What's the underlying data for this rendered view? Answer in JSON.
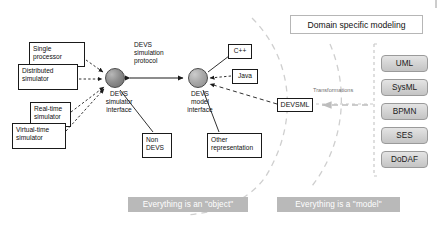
{
  "diagram": {
    "title_box": {
      "label": "Domain specific modeling"
    },
    "nodes": [
      {
        "id": "devs-simulator-interface",
        "label": "DEVS\nsimulator\ninterface"
      },
      {
        "id": "devs-model-interface",
        "label": "DEVS\nmodel\ninterface"
      }
    ],
    "simulator_boxes": [
      {
        "id": "single-processor",
        "label": "Single\nprocessor"
      },
      {
        "id": "distributed-simulator",
        "label": "Distributed\nsimulator"
      },
      {
        "id": "real-time-simulator",
        "label": "Real-time\nsimulator"
      },
      {
        "id": "virtual-time-simulator",
        "label": "Virtual-time\nsimulator"
      }
    ],
    "model_boxes": [
      {
        "id": "cpp",
        "label": "C++"
      },
      {
        "id": "java",
        "label": "Java"
      },
      {
        "id": "non-devs",
        "label": "Non\nDEVS"
      },
      {
        "id": "other-representation",
        "label": "Other\nrepresentation"
      },
      {
        "id": "devsml",
        "label": "DEVSML"
      }
    ],
    "edge_labels": [
      {
        "id": "devs-simulation-protocol",
        "label": "DEVS\nsimulation\nprotocol"
      },
      {
        "id": "transformations",
        "label": "Transformations"
      }
    ],
    "dsl_chips": [
      {
        "id": "uml",
        "label": "UML"
      },
      {
        "id": "sysml",
        "label": "SysML"
      },
      {
        "id": "bpmn",
        "label": "BPMN"
      },
      {
        "id": "ses",
        "label": "SES"
      },
      {
        "id": "dodaf",
        "label": "DoDAF"
      }
    ],
    "banners": [
      {
        "id": "object-banner",
        "label": "Everything is an \"object\""
      },
      {
        "id": "model-banner",
        "label": "Everything is a \"model\""
      }
    ],
    "colors": {
      "banner_bg": "#b9b9b9",
      "banner_text": "#ffffff",
      "chip_bg": "#d6d6d6",
      "node_dark": "#8e8e8e",
      "node_light": "#aaaaaa",
      "line": "#1a1a1a",
      "dashed_guide": "#c9c9c9"
    }
  }
}
